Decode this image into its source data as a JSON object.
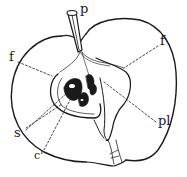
{
  "diagram": {
    "colors": {
      "ink": "#1a1a1a",
      "background": "#ffffff"
    },
    "labels": {
      "stalk": "p",
      "flesh_left": "f",
      "flesh_right": "f",
      "seed": "s",
      "core": "c'",
      "placenta": "pl"
    }
  }
}
